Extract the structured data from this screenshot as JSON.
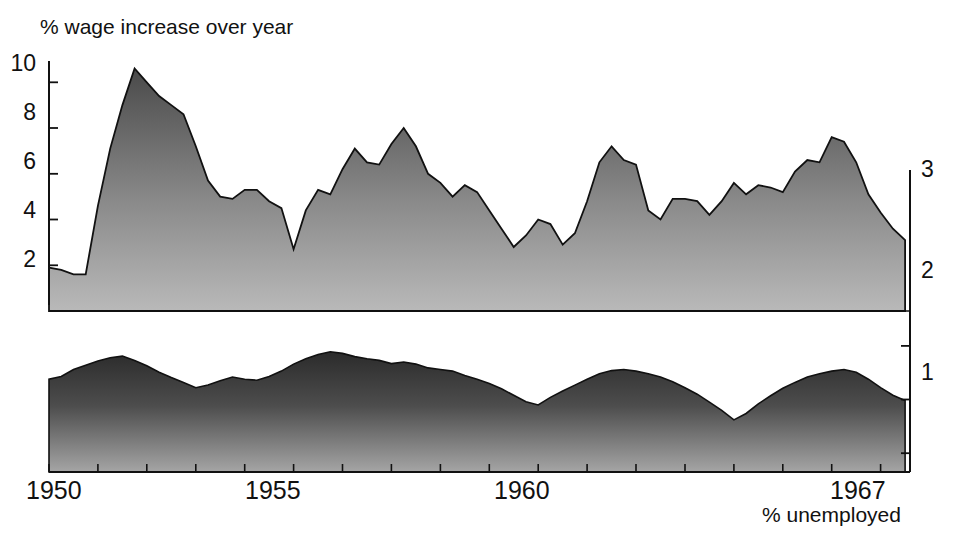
{
  "chart_data": {
    "type": "area",
    "title": "% wage increase over year",
    "xlabel": "% unemployed",
    "ylabel": "% wage increase over year",
    "grid": false,
    "legend": "none",
    "x": [
      1950.0,
      1950.25,
      1950.5,
      1950.75,
      1951.0,
      1951.25,
      1951.5,
      1951.75,
      1952.0,
      1952.25,
      1952.5,
      1952.75,
      1953.0,
      1953.25,
      1953.5,
      1953.75,
      1954.0,
      1954.25,
      1954.5,
      1954.75,
      1955.0,
      1955.25,
      1955.5,
      1955.75,
      1956.0,
      1956.25,
      1956.5,
      1956.75,
      1957.0,
      1957.25,
      1957.5,
      1957.75,
      1958.0,
      1958.25,
      1958.5,
      1958.75,
      1959.0,
      1959.25,
      1959.5,
      1959.75,
      1960.0,
      1960.25,
      1960.5,
      1960.75,
      1961.0,
      1961.25,
      1961.5,
      1961.75,
      1962.0,
      1962.25,
      1962.5,
      1962.75,
      1963.0,
      1963.25,
      1963.5,
      1963.75,
      1964.0,
      1964.25,
      1964.5,
      1964.75,
      1965.0,
      1965.25,
      1965.5,
      1965.75,
      1966.0,
      1966.25,
      1966.5,
      1966.75,
      1967.0,
      1967.25,
      1967.5
    ],
    "xlim": [
      1950.0,
      1967.6
    ],
    "xticks": [
      1950,
      1951,
      1952,
      1953,
      1954,
      1955,
      1956,
      1957,
      1958,
      1959,
      1960,
      1961,
      1962,
      1963,
      1964,
      1965,
      1966,
      1967
    ],
    "xtick_labels_shown": [
      "1950",
      "1955",
      "1960",
      "1967"
    ],
    "axis_left": {
      "label": "% wage increase over year",
      "ticks": [
        2,
        4,
        6,
        8,
        10
      ],
      "lim": [
        0,
        10.8
      ],
      "position": "left"
    },
    "axis_right": {
      "label": "% unemployed",
      "ticks": [
        1,
        2,
        3
      ],
      "lim": [
        0.35,
        3.35
      ],
      "inverted": true,
      "position": "right"
    },
    "series": [
      {
        "name": "% wage increase over year",
        "axis": "left",
        "fill": "#6e6e6e",
        "values": [
          1.9,
          1.8,
          1.6,
          1.6,
          4.6,
          7.1,
          9.0,
          10.6,
          10.0,
          9.4,
          9.0,
          8.6,
          7.2,
          5.7,
          5.0,
          4.9,
          5.3,
          5.3,
          4.8,
          4.5,
          2.7,
          4.4,
          5.3,
          5.1,
          6.2,
          7.1,
          6.5,
          6.4,
          7.3,
          8.0,
          7.2,
          6.0,
          5.6,
          5.0,
          5.5,
          5.2,
          4.4,
          3.6,
          2.8,
          3.3,
          4.0,
          3.8,
          2.9,
          3.4,
          4.8,
          6.5,
          7.2,
          6.6,
          6.4,
          4.4,
          4.0,
          4.9,
          4.9,
          4.8,
          4.2,
          4.8,
          5.6,
          5.1,
          5.5,
          5.4,
          5.2,
          6.1,
          6.6,
          6.5,
          7.6,
          7.4,
          6.5,
          5.1,
          4.3,
          3.6,
          3.1
        ]
      },
      {
        "name": "% unemployed",
        "axis": "right",
        "fill": "#3a3a3a",
        "values": [
          1.62,
          1.57,
          1.44,
          1.36,
          1.28,
          1.22,
          1.19,
          1.27,
          1.37,
          1.49,
          1.59,
          1.68,
          1.78,
          1.73,
          1.65,
          1.58,
          1.62,
          1.64,
          1.57,
          1.47,
          1.34,
          1.24,
          1.16,
          1.11,
          1.14,
          1.2,
          1.24,
          1.27,
          1.33,
          1.3,
          1.34,
          1.41,
          1.44,
          1.47,
          1.55,
          1.62,
          1.7,
          1.8,
          1.92,
          2.04,
          2.1,
          1.96,
          1.84,
          1.73,
          1.62,
          1.52,
          1.46,
          1.44,
          1.47,
          1.52,
          1.58,
          1.67,
          1.78,
          1.9,
          2.05,
          2.2,
          2.38,
          2.26,
          2.08,
          1.93,
          1.79,
          1.68,
          1.58,
          1.52,
          1.47,
          1.44,
          1.49,
          1.62,
          1.78,
          1.92,
          2.02
        ]
      }
    ]
  },
  "labels": {
    "title": "% wage increase over year",
    "xcaption": "% unemployed",
    "left_ticks": [
      "10",
      "8",
      "6",
      "4",
      "2"
    ],
    "right_ticks": [
      "3",
      "2",
      "1"
    ],
    "x_ticks": [
      "1950",
      "1955",
      "1960",
      "1967"
    ]
  }
}
